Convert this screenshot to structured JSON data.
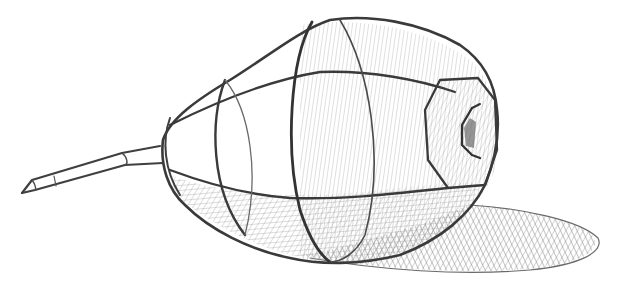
{
  "image": {
    "subject": "pencil construction sketch of a pear",
    "medium": "graphite pencil on white paper",
    "palette": {
      "paper": "#ffffff",
      "dark_line": "#3a3a3a",
      "mid_line": "#5a5a5a",
      "hatch": "#8a8a8a",
      "light_hatch": "#b0b0b0"
    },
    "elements": [
      "stem",
      "tapered neck",
      "cross-contour ellipses",
      "main body",
      "faceted blossom end",
      "cast shadow"
    ]
  }
}
